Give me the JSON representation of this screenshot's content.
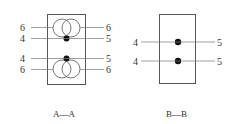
{
  "sections": [
    {
      "id": "A-A",
      "caption": "A—A",
      "labels": {
        "top_left_6": "6",
        "top_right_6": "6",
        "top_left_4": "4",
        "top_right_5": "5",
        "bottom_left_4": "4",
        "bottom_right_5": "5",
        "bottom_left_6": "6",
        "bottom_right_6": "6"
      }
    },
    {
      "id": "B-B",
      "caption": "B—B",
      "labels": {
        "top_left_4": "4",
        "top_right_5": "5",
        "bottom_left_4": "4",
        "bottom_right_5": "5"
      }
    }
  ],
  "colors": {
    "line": "#555555",
    "dot": "#111111"
  }
}
